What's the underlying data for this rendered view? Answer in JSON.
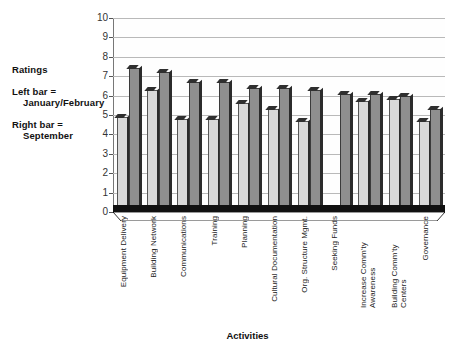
{
  "legend": {
    "ratings_label": "Ratings",
    "left_bar_line1": "Left bar =",
    "left_bar_line2": "January/February",
    "right_bar_line1": "Right bar =",
    "right_bar_line2": "September"
  },
  "axis": {
    "x_title": "Activities",
    "y_ticks": [
      "10",
      "9",
      "8",
      "7",
      "6",
      "5",
      "4",
      "3",
      "2",
      "1",
      "0"
    ]
  },
  "chart_data": {
    "type": "bar",
    "title": "",
    "xlabel": "Activities",
    "ylabel": "Ratings",
    "ylim": [
      0,
      10
    ],
    "ytick_values": [
      0,
      1,
      2,
      3,
      4,
      5,
      6,
      7,
      8,
      9,
      10
    ],
    "grid": true,
    "legend_position": "left-outside",
    "categories": [
      "Equipment Delivery",
      "Building Network",
      "Communications",
      "Training",
      "Planning",
      "Cultural Documentation",
      "Org. Structure Mgmt.",
      "Seeking Funds",
      "Increase Comm'ty Awareness",
      "Building Comm'ty Centers",
      "Governance"
    ],
    "series": [
      {
        "name": "January/February",
        "position": "left bar",
        "color": "#d9d9d9",
        "values": [
          4.9,
          6.3,
          4.8,
          4.8,
          5.6,
          5.3,
          4.7,
          null,
          5.7,
          5.8,
          4.7
        ]
      },
      {
        "name": "September",
        "position": "right bar",
        "color": "#8f8f8f",
        "values": [
          7.4,
          7.2,
          6.7,
          6.7,
          6.4,
          6.4,
          6.3,
          6.1,
          6.1,
          6.0,
          5.3
        ]
      }
    ]
  }
}
